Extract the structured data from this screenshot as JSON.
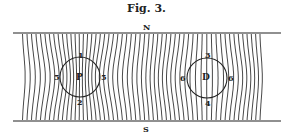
{
  "title": "Fig. 3.",
  "labels": {
    "north": "N",
    "south": "S",
    "left_circle": {
      "center": "P",
      "top": "1",
      "bottom": "2",
      "left": "5",
      "right": "5"
    },
    "right_circle": {
      "center": "D",
      "top": "3",
      "bottom": "4",
      "left": "6",
      "right": "6"
    }
  },
  "colors": {
    "ink": "#222222",
    "paper": "#ffffff"
  }
}
